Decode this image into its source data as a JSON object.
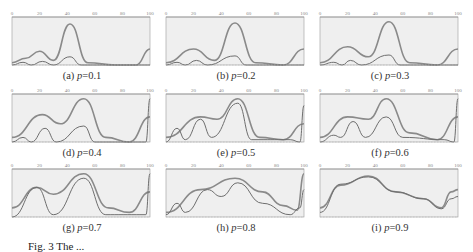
{
  "chart_data": [
    {
      "type": "line",
      "id": "a",
      "caption": "(a) p=0.1",
      "p": 0.1,
      "xticks": [
        0,
        20,
        40,
        60,
        80,
        100
      ],
      "xlim": [
        0,
        100
      ],
      "series": [
        {
          "name": "upper",
          "points": [
            [
              0,
              5
            ],
            [
              10,
              15
            ],
            [
              20,
              30
            ],
            [
              30,
              10
            ],
            [
              42,
              90
            ],
            [
              55,
              5
            ],
            [
              75,
              0
            ],
            [
              90,
              0
            ],
            [
              100,
              35
            ]
          ]
        },
        {
          "name": "lower",
          "points": [
            [
              0,
              0
            ],
            [
              8,
              6
            ],
            [
              14,
              0
            ],
            [
              22,
              8
            ],
            [
              30,
              0
            ],
            [
              42,
              18
            ],
            [
              50,
              0
            ],
            [
              100,
              0
            ]
          ]
        }
      ]
    },
    {
      "type": "line",
      "id": "b",
      "caption": "(b) p=0.2",
      "p": 0.2,
      "xticks": [
        0,
        20,
        40,
        60,
        80,
        100
      ],
      "xlim": [
        0,
        100
      ],
      "series": [
        {
          "name": "upper",
          "points": [
            [
              0,
              5
            ],
            [
              20,
              35
            ],
            [
              35,
              10
            ],
            [
              50,
              92
            ],
            [
              65,
              5
            ],
            [
              85,
              0
            ],
            [
              100,
              35
            ]
          ]
        },
        {
          "name": "lower",
          "points": [
            [
              0,
              0
            ],
            [
              8,
              6
            ],
            [
              14,
              0
            ],
            [
              22,
              10
            ],
            [
              30,
              0
            ],
            [
              50,
              20
            ],
            [
              58,
              0
            ],
            [
              100,
              0
            ]
          ]
        }
      ]
    },
    {
      "type": "line",
      "id": "c",
      "caption": "(c) p=0.3",
      "p": 0.3,
      "xticks": [
        0,
        20,
        40,
        60,
        80,
        100
      ],
      "xlim": [
        0,
        100
      ],
      "series": [
        {
          "name": "upper",
          "points": [
            [
              0,
              5
            ],
            [
              20,
              40
            ],
            [
              35,
              18
            ],
            [
              50,
              95
            ],
            [
              65,
              5
            ],
            [
              85,
              0
            ],
            [
              100,
              35
            ]
          ]
        },
        {
          "name": "lower",
          "points": [
            [
              0,
              0
            ],
            [
              10,
              6
            ],
            [
              16,
              0
            ],
            [
              22,
              10
            ],
            [
              30,
              0
            ],
            [
              50,
              22
            ],
            [
              58,
              0
            ],
            [
              100,
              0
            ]
          ]
        }
      ]
    },
    {
      "type": "line",
      "id": "d",
      "caption": "(d) p=0.4",
      "p": 0.4,
      "xticks": [
        0,
        20,
        40,
        60,
        80,
        100
      ],
      "xlim": [
        0,
        100
      ],
      "series": [
        {
          "name": "upper",
          "points": [
            [
              0,
              10
            ],
            [
              22,
              60
            ],
            [
              35,
              40
            ],
            [
              52,
              95
            ],
            [
              68,
              10
            ],
            [
              85,
              0
            ],
            [
              100,
              55
            ]
          ]
        },
        {
          "name": "lower",
          "points": [
            [
              0,
              0
            ],
            [
              8,
              10
            ],
            [
              14,
              0
            ],
            [
              24,
              30
            ],
            [
              32,
              0
            ],
            [
              52,
              35
            ],
            [
              60,
              0
            ],
            [
              97,
              0
            ],
            [
              100,
              95
            ]
          ]
        }
      ]
    },
    {
      "type": "line",
      "id": "e",
      "caption": "(e) p=0.5",
      "p": 0.5,
      "xticks": [
        0,
        20,
        40,
        60,
        80,
        100
      ],
      "xlim": [
        0,
        100
      ],
      "series": [
        {
          "name": "upper",
          "points": [
            [
              0,
              10
            ],
            [
              25,
              55
            ],
            [
              37,
              50
            ],
            [
              52,
              95
            ],
            [
              68,
              10
            ],
            [
              85,
              5
            ],
            [
              100,
              40
            ]
          ]
        },
        {
          "name": "lower",
          "points": [
            [
              0,
              0
            ],
            [
              8,
              30
            ],
            [
              14,
              5
            ],
            [
              25,
              50
            ],
            [
              33,
              10
            ],
            [
              52,
              85
            ],
            [
              62,
              5
            ],
            [
              90,
              5
            ],
            [
              97,
              0
            ],
            [
              100,
              80
            ]
          ]
        }
      ]
    },
    {
      "type": "line",
      "id": "f",
      "caption": "(f) p=0.6",
      "p": 0.6,
      "xticks": [
        0,
        20,
        40,
        60,
        80,
        100
      ],
      "xlim": [
        0,
        100
      ],
      "series": [
        {
          "name": "upper",
          "points": [
            [
              0,
              10
            ],
            [
              20,
              55
            ],
            [
              35,
              50
            ],
            [
              48,
              95
            ],
            [
              65,
              20
            ],
            [
              85,
              5
            ],
            [
              100,
              55
            ]
          ]
        },
        {
          "name": "lower",
          "points": [
            [
              0,
              0
            ],
            [
              10,
              15
            ],
            [
              15,
              10
            ],
            [
              24,
              45
            ],
            [
              33,
              10
            ],
            [
              48,
              55
            ],
            [
              60,
              10
            ],
            [
              90,
              5
            ],
            [
              97,
              0
            ],
            [
              100,
              95
            ]
          ]
        }
      ]
    },
    {
      "type": "line",
      "id": "g",
      "caption": "(g) p=0.7",
      "p": 0.7,
      "xticks": [
        0,
        20,
        40,
        60,
        80,
        100
      ],
      "xlim": [
        0,
        100
      ],
      "series": [
        {
          "name": "upper",
          "points": [
            [
              0,
              20
            ],
            [
              18,
              65
            ],
            [
              30,
              50
            ],
            [
              52,
              95
            ],
            [
              70,
              20
            ],
            [
              85,
              10
            ],
            [
              100,
              55
            ]
          ]
        },
        {
          "name": "lower",
          "points": [
            [
              0,
              0
            ],
            [
              18,
              65
            ],
            [
              30,
              5
            ],
            [
              52,
              85
            ],
            [
              68,
              5
            ],
            [
              90,
              5
            ],
            [
              97,
              5
            ],
            [
              100,
              95
            ]
          ]
        }
      ]
    },
    {
      "type": "line",
      "id": "h",
      "caption": "(h) p=0.8",
      "p": 0.8,
      "xticks": [
        0,
        20,
        40,
        60,
        80,
        100
      ],
      "xlim": [
        0,
        100
      ],
      "series": [
        {
          "name": "upper",
          "points": [
            [
              0,
              10
            ],
            [
              25,
              60
            ],
            [
              50,
              85
            ],
            [
              70,
              55
            ],
            [
              85,
              25
            ],
            [
              95,
              15
            ],
            [
              100,
              95
            ]
          ]
        },
        {
          "name": "lower",
          "points": [
            [
              0,
              5
            ],
            [
              8,
              30
            ],
            [
              14,
              10
            ],
            [
              30,
              60
            ],
            [
              40,
              45
            ],
            [
              52,
              75
            ],
            [
              70,
              30
            ],
            [
              90,
              5
            ],
            [
              97,
              20
            ],
            [
              100,
              60
            ]
          ]
        }
      ]
    },
    {
      "type": "line",
      "id": "i",
      "caption": "(i) p=0.9",
      "p": 0.9,
      "xticks": [
        0,
        20,
        40,
        60,
        80,
        100
      ],
      "xlim": [
        0,
        100
      ],
      "series": [
        {
          "name": "upper",
          "points": [
            [
              0,
              20
            ],
            [
              15,
              70
            ],
            [
              35,
              90
            ],
            [
              55,
              55
            ],
            [
              75,
              40
            ],
            [
              88,
              20
            ],
            [
              95,
              55
            ],
            [
              100,
              60
            ]
          ]
        },
        {
          "name": "lower",
          "points": [
            [
              0,
              10
            ],
            [
              15,
              72
            ],
            [
              35,
              88
            ],
            [
              55,
              55
            ],
            [
              75,
              40
            ],
            [
              88,
              18
            ],
            [
              95,
              40
            ],
            [
              100,
              45
            ]
          ]
        }
      ]
    }
  ],
  "figure_caption": "Fig. 3  The ...",
  "captions": [
    "(a) p=0.1",
    "(b) p=0.2",
    "(c) p=0.3",
    "(d) p=0.4",
    "(e) p=0.5",
    "(f) p=0.6",
    "(g) p=0.7",
    "(h) p=0.8",
    "(i) p=0.9"
  ],
  "colors": {
    "fill": "#efefef",
    "upper": "#8a8a8a",
    "lower": "#6e6e6e",
    "axis": "#999999"
  }
}
